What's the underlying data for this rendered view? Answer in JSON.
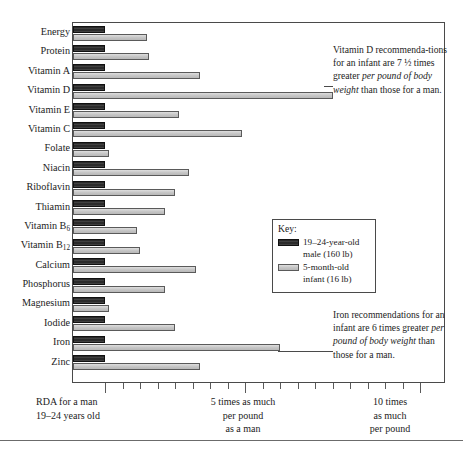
{
  "chart_data": {
    "type": "bar",
    "orientation": "horizontal",
    "title": "",
    "xlabel": "",
    "ylabel": "",
    "xlim": [
      0,
      11.65
    ],
    "grid": false,
    "legend_position": "inside-right",
    "categories": [
      "Energy",
      "Protein",
      "Vitamin A",
      "Vitamin D",
      "Vitamin E",
      "Vitamin C",
      "Folate",
      "Niacin",
      "Riboflavin",
      "Thiamin",
      "Vitamin B6",
      "Vitamin B12",
      "Calcium",
      "Phosphorus",
      "Magnesium",
      "Iodide",
      "Iron",
      "Zinc"
    ],
    "category_labels_html": [
      "Energy",
      "Protein",
      "Vitamin A",
      "Vitamin D",
      "Vitamin E",
      "Vitamin C",
      "Folate",
      "Niacin",
      "Riboflavin",
      "Thiamin",
      "Vitamin B<sub>6</sub>",
      "Vitamin B<sub>12</sub>",
      "Calcium",
      "Phosphorus",
      "Magnesium",
      "Iodide",
      "Iron",
      "Zinc"
    ],
    "series": [
      {
        "name": "19–24-year-old male (160 lb)",
        "color": "#2b2b2b",
        "values": [
          1,
          1,
          1,
          1,
          1,
          1,
          1,
          1,
          1,
          1,
          1,
          1,
          1,
          1,
          1,
          1,
          1,
          1
        ]
      },
      {
        "name": "5-month-old infant (16 lb)",
        "color": "#c9c9c9",
        "values": [
          2.2,
          2.25,
          3.7,
          7.5,
          3.1,
          4.9,
          1.1,
          3.4,
          3.0,
          2.7,
          1.9,
          2.0,
          3.6,
          2.7,
          1.1,
          3.0,
          6.0,
          3.7
        ]
      }
    ],
    "xticks": [
      1,
      1.5,
      2,
      2.5,
      3,
      3.5,
      4,
      4.5,
      5,
      5.5,
      6,
      6.5,
      7,
      7.5,
      8,
      8.5,
      9,
      9.5,
      10
    ],
    "xtick_major": [
      1,
      5,
      10
    ],
    "xtick_captions": [
      {
        "at": 1,
        "lines": [
          "RDA for a man",
          "19–24 years old"
        ]
      },
      {
        "at": 5,
        "lines": [
          "5 times as much",
          "per pound",
          "as a man"
        ]
      },
      {
        "at": 10,
        "lines": [
          "10 times",
          "as much",
          "per pound"
        ]
      }
    ]
  },
  "legend": {
    "title": "Key:",
    "entries": [
      {
        "line1": "19–24-year-old",
        "line2": "male (160 lb)"
      },
      {
        "line1": "5-month-old",
        "line2": "infant (16 lb)"
      }
    ]
  },
  "annotations": {
    "vitamin_d": {
      "segments": [
        {
          "text": "Vitamin D recommenda-tions for an infant are 7 ",
          "italic": false
        },
        {
          "text": "½",
          "italic": false
        },
        {
          "text": " times greater ",
          "italic": false
        },
        {
          "text": "per pound of body weight",
          "italic": true
        },
        {
          "text": " than those for a man.",
          "italic": false
        }
      ],
      "plain": "Vitamin D recommendations for an infant are 7 ½ times greater per pound of body weight than those for a man."
    },
    "iron": {
      "segments": [
        {
          "text": "Iron recommendations for an infant are 6 times greater ",
          "italic": false
        },
        {
          "text": "per pound of body weight",
          "italic": true
        },
        {
          "text": " than those for a man.",
          "italic": false
        }
      ],
      "plain": "Iron recommendations for an infant are 6 times greater per pound of body weight than those for a man."
    }
  },
  "colors": {
    "male_bar": "#2b2b2b",
    "infant_bar": "#c9c9c9",
    "frame": "#4a4a4a",
    "text": "#1c1c1c",
    "background": "#ffffff"
  }
}
